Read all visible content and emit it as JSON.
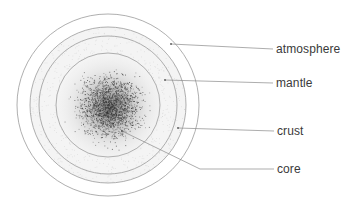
{
  "diagram": {
    "center": {
      "x": 108,
      "y": 105
    },
    "rings": [
      {
        "name": "outer-ring",
        "r": 91
      },
      {
        "name": "crust-ring",
        "r": 78
      },
      {
        "name": "mantle-outer-ring",
        "r": 69
      },
      {
        "name": "core-ring",
        "r": 52
      }
    ],
    "labels": [
      {
        "text": "atmosphere",
        "x": 276,
        "y": 42,
        "dot": {
          "x": 171,
          "y": 44
        }
      },
      {
        "text": "mantle",
        "x": 276,
        "y": 76,
        "dot": {
          "x": 165,
          "y": 80
        }
      },
      {
        "text": "crust",
        "x": 277,
        "y": 124,
        "dot": {
          "x": 178,
          "y": 128
        }
      },
      {
        "text": "core",
        "x": 277,
        "y": 162,
        "dot": {
          "x": 122,
          "y": 131
        }
      }
    ],
    "colors": {
      "ring": "#9a9a9a",
      "leader": "#8a8a8a",
      "text": "#3a3a3a",
      "speckle": "#333333"
    }
  }
}
